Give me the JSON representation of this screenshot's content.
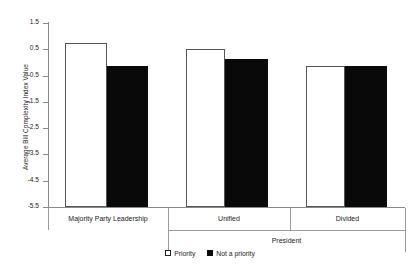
{
  "chart_data": {
    "type": "bar",
    "title": "",
    "xlabel": "",
    "ylabel": "Average Bill Complexity Index Value",
    "ylim": [
      -5.5,
      1.5
    ],
    "yticks": [
      1.5,
      0.5,
      -0.5,
      -1.5,
      -2.5,
      -3.5,
      -4.5,
      -5.5
    ],
    "ytick_labels": [
      "1.5",
      "0.5",
      "-0.5",
      "-1.5",
      "-2.5",
      "-3.5",
      "-4.5",
      "-5.5"
    ],
    "grid": false,
    "legend_position": "bottom-center",
    "categories": [
      "Majority Party Leadership",
      "Unified",
      "Divided"
    ],
    "group_header": {
      "label": "President",
      "spans": [
        "Unified",
        "Divided"
      ]
    },
    "series": [
      {
        "name": "Priority",
        "color": "#ffffff",
        "edgecolor": "#555555",
        "values": [
          0.73,
          0.5,
          -0.15
        ]
      },
      {
        "name": "Not a priority",
        "color": "#0a0a0a",
        "edgecolor": "#0a0a0a",
        "values": [
          -0.12,
          0.12,
          -0.12
        ]
      }
    ]
  },
  "legend": {
    "items": [
      {
        "label": "Priority"
      },
      {
        "label": "Not a priority"
      }
    ]
  },
  "axis": {
    "y_title": "Average Bill Complexity Index Value"
  }
}
